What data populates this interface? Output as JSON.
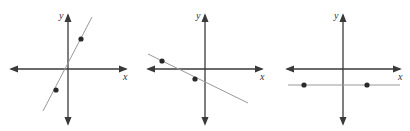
{
  "graphs": [
    {
      "name": "positive-slope-graph",
      "x_label": "x",
      "y_label": "y",
      "origin": [
        68,
        69
      ],
      "x_axis": [
        11,
        126
      ],
      "y_axis": [
        15,
        124
      ],
      "line": [
        [
          43,
          111
        ],
        [
          92,
          17
        ]
      ],
      "points": [
        [
          81,
          39
        ],
        [
          56,
          90
        ]
      ],
      "slope": "positive"
    },
    {
      "name": "negative-slope-graph",
      "x_label": "x",
      "y_label": "y",
      "origin": [
        205,
        69
      ],
      "x_axis": [
        148,
        262
      ],
      "y_axis": [
        15,
        124
      ],
      "line": [
        [
          148,
          54
        ],
        [
          248,
          103
        ]
      ],
      "points": [
        [
          162,
          61
        ],
        [
          195,
          79
        ]
      ],
      "slope": "negative"
    },
    {
      "name": "zero-slope-graph",
      "x_label": "x",
      "y_label": "y",
      "origin": [
        343,
        69
      ],
      "x_axis": [
        287,
        400
      ],
      "y_axis": [
        15,
        124
      ],
      "line": [
        [
          288,
          85
        ],
        [
          400,
          85
        ]
      ],
      "points": [
        [
          304,
          85
        ],
        [
          367,
          85
        ]
      ],
      "slope": "zero"
    }
  ],
  "colors": {
    "axis": "#3a3a3a",
    "line": "#9a9a9a",
    "point": "#2a2a2a"
  }
}
